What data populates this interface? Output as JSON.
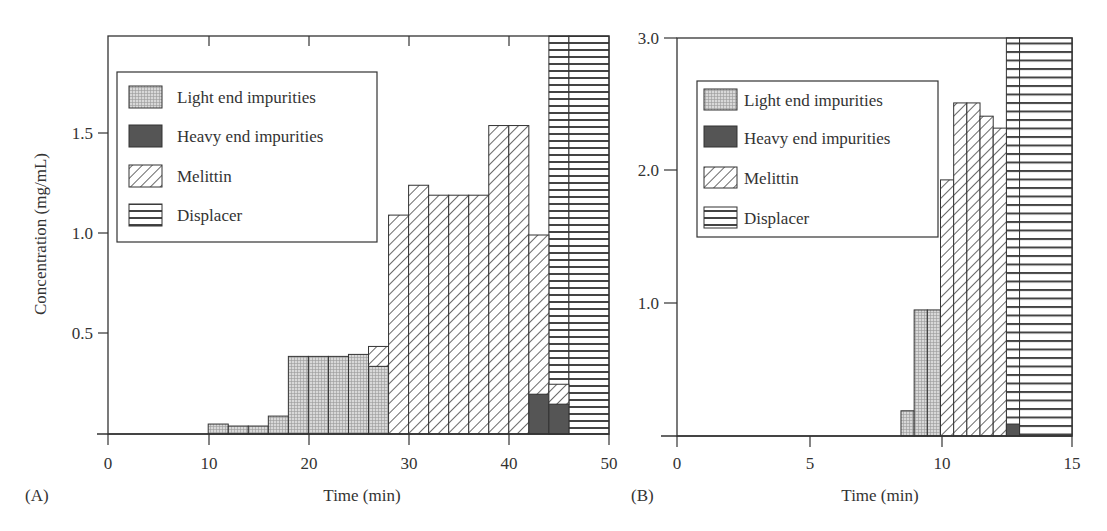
{
  "chart_data": [
    {
      "panel": "(A)",
      "type": "bar",
      "subtype": "stacked-histogram",
      "xlabel": "Time (min)",
      "ylabel": "Concentration (mg/mL)",
      "xlim": [
        0,
        50
      ],
      "ylim": [
        0,
        2.0
      ],
      "xticks": [
        "0",
        "10",
        "20",
        "30",
        "40",
        "50"
      ],
      "yticks": [
        "0.5",
        "1.0",
        "1.5"
      ],
      "grid": false,
      "legend": {
        "position": "upper-left",
        "entries": [
          "Light end impurities",
          "Heavy end impurities",
          "Melittin",
          "Displacer"
        ]
      },
      "bin_width_min": 2,
      "bins": [
        {
          "start": 10,
          "end": 12,
          "light": 0.05,
          "heavy": 0,
          "melittin": 0,
          "displacer": 0
        },
        {
          "start": 12,
          "end": 14,
          "light": 0.04,
          "heavy": 0,
          "melittin": 0,
          "displacer": 0
        },
        {
          "start": 14,
          "end": 16,
          "light": 0.04,
          "heavy": 0,
          "melittin": 0,
          "displacer": 0
        },
        {
          "start": 16,
          "end": 18,
          "light": 0.09,
          "heavy": 0,
          "melittin": 0,
          "displacer": 0
        },
        {
          "start": 18,
          "end": 20,
          "light": 0.39,
          "heavy": 0,
          "melittin": 0,
          "displacer": 0
        },
        {
          "start": 20,
          "end": 22,
          "light": 0.39,
          "heavy": 0,
          "melittin": 0,
          "displacer": 0
        },
        {
          "start": 22,
          "end": 24,
          "light": 0.39,
          "heavy": 0,
          "melittin": 0,
          "displacer": 0
        },
        {
          "start": 24,
          "end": 26,
          "light": 0.4,
          "heavy": 0,
          "melittin": 0,
          "displacer": 0
        },
        {
          "start": 26,
          "end": 28,
          "light": 0.34,
          "heavy": 0,
          "melittin": 0.1,
          "displacer": 0
        },
        {
          "start": 28,
          "end": 30,
          "light": 0,
          "heavy": 0,
          "melittin": 1.1,
          "displacer": 0
        },
        {
          "start": 30,
          "end": 32,
          "light": 0,
          "heavy": 0,
          "melittin": 1.25,
          "displacer": 0
        },
        {
          "start": 32,
          "end": 34,
          "light": 0,
          "heavy": 0,
          "melittin": 1.2,
          "displacer": 0
        },
        {
          "start": 34,
          "end": 36,
          "light": 0,
          "heavy": 0,
          "melittin": 1.2,
          "displacer": 0
        },
        {
          "start": 36,
          "end": 38,
          "light": 0,
          "heavy": 0,
          "melittin": 1.2,
          "displacer": 0
        },
        {
          "start": 38,
          "end": 40,
          "light": 0,
          "heavy": 0,
          "melittin": 1.55,
          "displacer": 0
        },
        {
          "start": 40,
          "end": 42,
          "light": 0,
          "heavy": 0,
          "melittin": 1.55,
          "displacer": 0
        },
        {
          "start": 42,
          "end": 44,
          "light": 0,
          "heavy": 0.2,
          "melittin": 0.8,
          "displacer": 0
        },
        {
          "start": 44,
          "end": 46,
          "light": 0,
          "heavy": 0.15,
          "melittin": 0.1,
          "displacer": 2.0
        },
        {
          "start": 46,
          "end": 50,
          "light": 0,
          "heavy": 0,
          "melittin": 0,
          "displacer": 2.0
        }
      ]
    },
    {
      "panel": "(B)",
      "type": "bar",
      "subtype": "stacked-histogram",
      "xlabel": "Time (min)",
      "ylabel": "",
      "xlim": [
        0,
        15
      ],
      "ylim": [
        0,
        3.0
      ],
      "xticks": [
        "0",
        "5",
        "10",
        "15"
      ],
      "yticks": [
        "1.0",
        "2.0",
        "3.0"
      ],
      "grid": false,
      "legend": {
        "position": "upper-left",
        "entries": [
          "Light end impurities",
          "Heavy end impurities",
          "Melittin",
          "Displacer"
        ]
      },
      "bin_width_min": 0.5,
      "bins": [
        {
          "start": 8.5,
          "end": 9.0,
          "light": 0.19,
          "heavy": 0,
          "melittin": 0,
          "displacer": 0
        },
        {
          "start": 9.0,
          "end": 9.5,
          "light": 0.95,
          "heavy": 0,
          "melittin": 0,
          "displacer": 0
        },
        {
          "start": 9.5,
          "end": 10.0,
          "light": 0.95,
          "heavy": 0,
          "melittin": 0,
          "displacer": 0
        },
        {
          "start": 10.0,
          "end": 10.5,
          "light": 0,
          "heavy": 0,
          "melittin": 1.93,
          "displacer": 0
        },
        {
          "start": 10.5,
          "end": 11.0,
          "light": 0,
          "heavy": 0,
          "melittin": 2.51,
          "displacer": 0
        },
        {
          "start": 11.0,
          "end": 11.5,
          "light": 0,
          "heavy": 0,
          "melittin": 2.51,
          "displacer": 0
        },
        {
          "start": 11.5,
          "end": 12.0,
          "light": 0,
          "heavy": 0,
          "melittin": 2.41,
          "displacer": 0
        },
        {
          "start": 12.0,
          "end": 12.5,
          "light": 0,
          "heavy": 0,
          "melittin": 2.32,
          "displacer": 0
        },
        {
          "start": 12.5,
          "end": 13.0,
          "light": 0,
          "heavy": 0.09,
          "melittin": 0,
          "displacer": 3.0
        },
        {
          "start": 13.0,
          "end": 15.0,
          "light": 0,
          "heavy": 0,
          "melittin": 0,
          "displacer": 3.0
        }
      ]
    }
  ],
  "panelA": {
    "label": "(A)",
    "xlabel": "Time (min)",
    "ylabel": "Concentration (mg/mL)",
    "xticks": [
      "0",
      "10",
      "20",
      "30",
      "40",
      "50"
    ],
    "yticks": [
      "0.5",
      "1.0",
      "1.5"
    ],
    "legend": [
      "Light end impurities",
      "Heavy end impurities",
      "Melittin",
      "Displacer"
    ]
  },
  "panelB": {
    "label": "(B)",
    "xlabel": "Time (min)",
    "xticks": [
      "0",
      "5",
      "10",
      "15"
    ],
    "yticks": [
      "1.0",
      "2.0",
      "3.0"
    ],
    "legend": [
      "Light end impurities",
      "Heavy end impurities",
      "Melittin",
      "Displacer"
    ]
  },
  "colors": {
    "axis": "#333333",
    "light_fill": "#d4d4d4",
    "heavy_fill": "#555555",
    "hatch": "#444444",
    "background": "#ffffff"
  }
}
